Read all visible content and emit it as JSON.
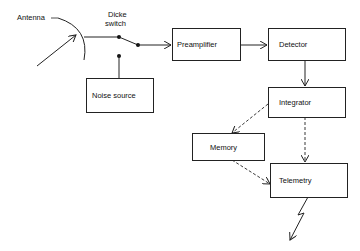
{
  "labels": {
    "antenna": "Antenna",
    "dicke_line1": "Dicke",
    "dicke_line2": "switch"
  },
  "blocks": {
    "preamplifier": "Preamplifier",
    "detector": "Detector",
    "integrator": "Integrator",
    "memory": "Memory",
    "telemetry": "Telemetry",
    "noise_source": "Noise source"
  },
  "colors": {
    "line": "#222222",
    "background": "#ffffff"
  }
}
